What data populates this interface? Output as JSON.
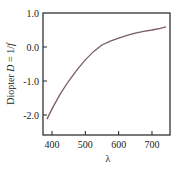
{
  "chart_data": {
    "type": "line",
    "title": "",
    "xlabel": "λ",
    "ylabel": "Diopter D = 1/f",
    "ylabel_parts": [
      "Diopter ",
      "D",
      " = 1/",
      "f"
    ],
    "xlim": [
      372,
      755
    ],
    "ylim": [
      -2.6,
      1.0
    ],
    "x_ticks": [
      400,
      500,
      600,
      700
    ],
    "x_tick_labels": [
      "400",
      "500",
      "600",
      "700"
    ],
    "y_ticks": [
      1.0,
      0.0,
      -1.0,
      -2.0
    ],
    "y_tick_labels": [
      "1.0",
      "0.0",
      "-1.0",
      "-2.0"
    ],
    "grid": false,
    "legend": null,
    "series": [
      {
        "name": "Diopter",
        "color": "#7a5a6a",
        "x": [
          385,
          400,
          425,
          450,
          475,
          500,
          525,
          550,
          575,
          600,
          625,
          650,
          675,
          700,
          725,
          742
        ],
        "y": [
          -2.12,
          -1.82,
          -1.38,
          -1.0,
          -0.67,
          -0.38,
          -0.13,
          0.06,
          0.17,
          0.26,
          0.34,
          0.41,
          0.46,
          0.5,
          0.55,
          0.59
        ]
      }
    ]
  }
}
